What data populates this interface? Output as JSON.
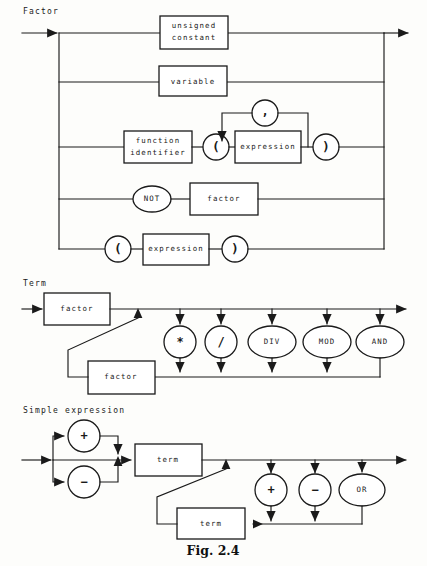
{
  "figure": {
    "caption": "Fig. 2.4",
    "background_color": "#fdfdfb",
    "ink_color": "#1a1a1a"
  },
  "sections": [
    {
      "id": "factor",
      "title": "Factor",
      "alternatives": [
        {
          "label": "unsigned\nconstant",
          "shape": "box",
          "line": 1
        },
        {
          "label": "variable",
          "shape": "box",
          "line": 2
        },
        {
          "label": "function\nidentifier",
          "shape": "box",
          "line": 3
        },
        {
          "label": "(",
          "shape": "circle",
          "line": 3
        },
        {
          "label": "expression",
          "shape": "box",
          "line": 3
        },
        {
          "label": ")",
          "shape": "circle",
          "line": 3
        },
        {
          "label": ",",
          "shape": "circle",
          "line": "3-loop"
        },
        {
          "label": "NOT",
          "shape": "oval",
          "line": 4
        },
        {
          "label": "factor",
          "shape": "box",
          "line": 4
        },
        {
          "label": "(",
          "shape": "circle",
          "line": 5
        },
        {
          "label": "expression",
          "shape": "box",
          "line": 5
        },
        {
          "label": ")",
          "shape": "circle",
          "line": 5
        }
      ]
    },
    {
      "id": "term",
      "title": "Term",
      "alternatives": [
        {
          "label": "factor",
          "shape": "box",
          "line": 1
        },
        {
          "label": "factor",
          "shape": "box",
          "line": 2
        },
        {
          "label": "*",
          "shape": "circle",
          "line": "ops"
        },
        {
          "label": "/",
          "shape": "circle",
          "line": "ops"
        },
        {
          "label": "DIV",
          "shape": "oval",
          "line": "ops"
        },
        {
          "label": "MOD",
          "shape": "oval",
          "line": "ops"
        },
        {
          "label": "AND",
          "shape": "oval",
          "line": "ops"
        }
      ]
    },
    {
      "id": "simple-expression",
      "title": "Simple expression",
      "alternatives": [
        {
          "label": "+",
          "shape": "circle",
          "line": "sign"
        },
        {
          "label": "−",
          "shape": "circle",
          "line": "sign"
        },
        {
          "label": "term",
          "shape": "box",
          "line": 1
        },
        {
          "label": "term",
          "shape": "box",
          "line": 2
        },
        {
          "label": "+",
          "shape": "circle",
          "line": "ops"
        },
        {
          "label": "−",
          "shape": "circle",
          "line": "ops"
        },
        {
          "label": "OR",
          "shape": "oval",
          "line": "ops"
        }
      ]
    }
  ],
  "labels": {
    "factor_title": "Factor",
    "term_title": "Term",
    "simple_expression_title": "Simple expression",
    "unsigned": "unsigned",
    "constant": "constant",
    "variable": "variable",
    "function": "function",
    "identifier": "identifier",
    "expression": "expression",
    "not": "NOT",
    "factor": "factor",
    "term": "term",
    "lparen": "(",
    "rparen": ")",
    "comma": ",",
    "star": "*",
    "slash": "/",
    "div": "DIV",
    "mod": "MOD",
    "and": "AND",
    "plus": "+",
    "minus": "−",
    "or": "OR",
    "caption": "Fig. 2.4"
  }
}
